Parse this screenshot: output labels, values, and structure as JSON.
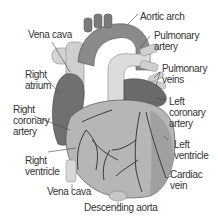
{
  "diagram": {
    "colors": {
      "background": "#ffffff",
      "text": "#333333",
      "leader_line": "#444444",
      "heart_body": "#b8b8b8",
      "atrium_dark": "#6e6e6e",
      "vessel_light": "#d8d8d8",
      "vessel_mid": "#9a9a9a",
      "coronary_vessel": "#3a3a3a"
    },
    "labels": [
      {
        "id": "vena-cava-top",
        "line1": "Vena cava",
        "line2": ""
      },
      {
        "id": "aortic-arch",
        "line1": "Aortic arch",
        "line2": ""
      },
      {
        "id": "pulmonary-artery",
        "line1": "Pulmonary",
        "line2": "artery"
      },
      {
        "id": "pulmonary-veins",
        "line1": "Pulmonary",
        "line2": "veins"
      },
      {
        "id": "right-atrium",
        "line1": "Right",
        "line2": "atrium"
      },
      {
        "id": "left-coronary-artery",
        "line1": "Left",
        "line2": "coronary",
        "line3": "artery"
      },
      {
        "id": "right-coronary-artery",
        "line1": "Right",
        "line2": "coronary",
        "line3": "artery"
      },
      {
        "id": "left-ventricle",
        "line1": "Left",
        "line2": "ventricle"
      },
      {
        "id": "right-ventricle",
        "line1": "Right",
        "line2": "ventricle"
      },
      {
        "id": "cardiac-vein",
        "line1": "Cardiac",
        "line2": "vein"
      },
      {
        "id": "vena-cava-bottom",
        "line1": "Vena cava",
        "line2": ""
      },
      {
        "id": "descending-aorta",
        "line1": "Descending aorta",
        "line2": ""
      }
    ]
  }
}
